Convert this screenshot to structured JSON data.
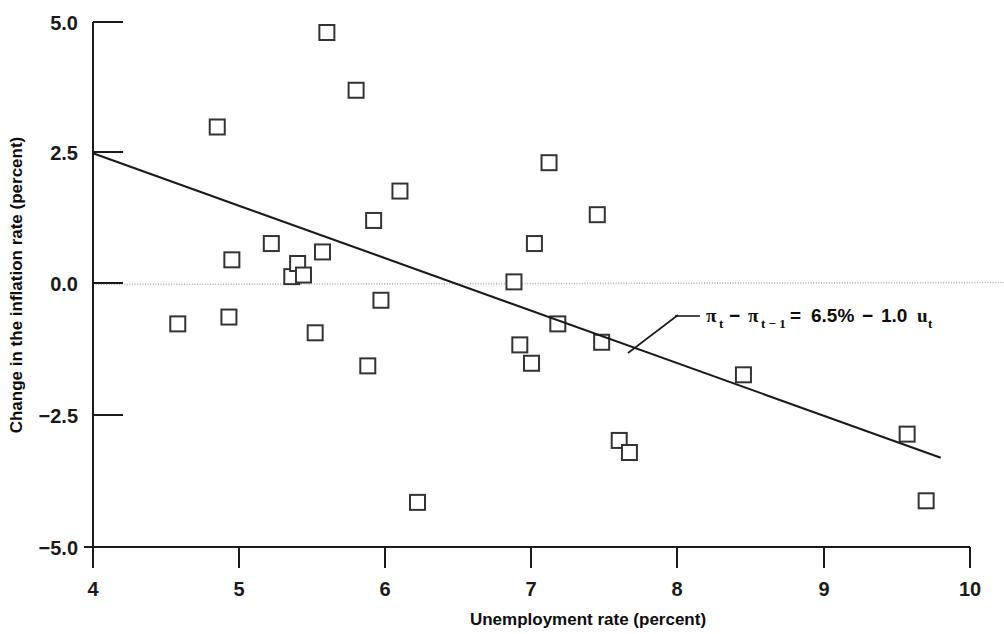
{
  "chart_data": {
    "type": "scatter",
    "title": "",
    "xlabel": "Unemployment rate (percent)",
    "ylabel": "Change in the inflation rate (percent)",
    "xlim": [
      4,
      10
    ],
    "ylim": [
      -5.0,
      5.0
    ],
    "xticks": [
      "4",
      "5",
      "6",
      "7",
      "8",
      "9",
      "10"
    ],
    "xtick_values": [
      4,
      5,
      6,
      7,
      8,
      9,
      10
    ],
    "yticks": [
      "5.0",
      "2.5",
      "0.0",
      "−2.5",
      "−5.0"
    ],
    "ytick_values": [
      5.0,
      2.5,
      0.0,
      -2.5,
      -5.0
    ],
    "grid": false,
    "zero_line": true,
    "zero_line_style": "dotted",
    "zero_line_color": "#b0b0b0",
    "marker": "open-square",
    "marker_color": "#333333",
    "legend": "none",
    "series": [
      {
        "name": "Observations",
        "points": [
          {
            "x": 4.58,
            "y": -0.75
          },
          {
            "x": 4.85,
            "y": 3.0
          },
          {
            "x": 4.93,
            "y": -0.62
          },
          {
            "x": 4.95,
            "y": 0.47
          },
          {
            "x": 5.22,
            "y": 0.78
          },
          {
            "x": 5.36,
            "y": 0.15
          },
          {
            "x": 5.4,
            "y": 0.4
          },
          {
            "x": 5.44,
            "y": 0.18
          },
          {
            "x": 5.52,
            "y": -0.92
          },
          {
            "x": 5.57,
            "y": 0.62
          },
          {
            "x": 5.6,
            "y": 4.8
          },
          {
            "x": 5.8,
            "y": 3.7
          },
          {
            "x": 5.88,
            "y": -1.55
          },
          {
            "x": 5.92,
            "y": 1.22
          },
          {
            "x": 5.97,
            "y": -0.3
          },
          {
            "x": 6.1,
            "y": 1.78
          },
          {
            "x": 6.22,
            "y": -4.15
          },
          {
            "x": 6.88,
            "y": 0.05
          },
          {
            "x": 6.92,
            "y": -1.15
          },
          {
            "x": 7.0,
            "y": -1.5
          },
          {
            "x": 7.02,
            "y": 0.78
          },
          {
            "x": 7.12,
            "y": 2.32
          },
          {
            "x": 7.18,
            "y": -0.75
          },
          {
            "x": 7.45,
            "y": 1.33
          },
          {
            "x": 7.48,
            "y": -1.1
          },
          {
            "x": 7.6,
            "y": -2.97
          },
          {
            "x": 7.67,
            "y": -3.2
          },
          {
            "x": 8.45,
            "y": -1.72
          },
          {
            "x": 9.57,
            "y": -2.85
          },
          {
            "x": 9.7,
            "y": -4.12
          }
        ]
      }
    ],
    "fit_line": {
      "label": "regression line",
      "intercept": 6.5,
      "slope": -1.0,
      "x_start": 4.0,
      "y_start": 2.5,
      "x_end": 9.8,
      "y_end": -3.3
    },
    "annotation": {
      "equation_parts": {
        "pi1": "π",
        "sub1": "t",
        "minus1": "−",
        "pi2": "π",
        "sub2": "t − 1",
        "equals": "=",
        "value1": "6.5%",
        "minus2": "−",
        "value2": "1.0",
        "u": "u",
        "sub3": "t"
      },
      "full_text": "πt − πt−1 = 6.5% − 1.0 ut",
      "leader_line": true
    }
  }
}
